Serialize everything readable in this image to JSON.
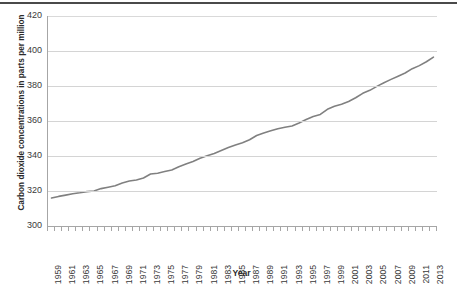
{
  "chart_data": {
    "type": "line",
    "title": "",
    "xlabel": "Year",
    "ylabel": "Carbon dioxide concentrations in parts per million",
    "ylim": [
      300,
      420
    ],
    "yticks": [
      300,
      320,
      340,
      360,
      380,
      400,
      420
    ],
    "xlim": [
      1959,
      2013
    ],
    "xticks": [
      1959,
      1961,
      1963,
      1965,
      1967,
      1969,
      1971,
      1973,
      1975,
      1977,
      1979,
      1981,
      1983,
      1985,
      1987,
      1989,
      1991,
      1993,
      1995,
      1997,
      1999,
      2001,
      2003,
      2005,
      2007,
      2009,
      2011,
      2013
    ],
    "grid": "horizontal",
    "legend": "none",
    "series": [
      {
        "name": "Carbon dioxide concentration",
        "color": "#808080",
        "x": [
          1959,
          1960,
          1961,
          1962,
          1963,
          1964,
          1965,
          1966,
          1967,
          1968,
          1969,
          1970,
          1971,
          1972,
          1973,
          1974,
          1975,
          1976,
          1977,
          1978,
          1979,
          1980,
          1981,
          1982,
          1983,
          1984,
          1985,
          1986,
          1987,
          1988,
          1989,
          1990,
          1991,
          1992,
          1993,
          1994,
          1995,
          1996,
          1997,
          1998,
          1999,
          2000,
          2001,
          2002,
          2003,
          2004,
          2005,
          2006,
          2007,
          2008,
          2009,
          2010,
          2011,
          2012,
          2013
        ],
        "values": [
          315.98,
          316.91,
          317.64,
          318.45,
          318.99,
          319.62,
          320.04,
          321.37,
          322.18,
          323.05,
          324.62,
          325.68,
          326.32,
          327.46,
          329.68,
          330.19,
          331.12,
          332.03,
          333.84,
          335.41,
          336.84,
          338.76,
          340.12,
          341.48,
          343.15,
          344.85,
          346.35,
          347.61,
          349.31,
          351.69,
          353.12,
          354.39,
          355.61,
          356.45,
          357.1,
          358.83,
          360.82,
          362.61,
          363.73,
          366.7,
          368.38,
          369.55,
          371.14,
          373.28,
          375.8,
          377.52,
          379.8,
          381.9,
          383.79,
          385.6,
          387.43,
          389.9,
          391.65,
          393.85,
          396.52
        ]
      }
    ]
  },
  "axis": {
    "y_title": "Carbon dioxide concentrations in parts per million",
    "x_title": "Year"
  }
}
